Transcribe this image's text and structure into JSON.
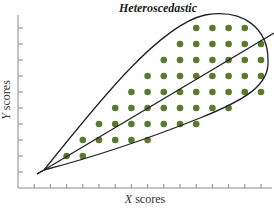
{
  "chart_data": {
    "type": "scatter",
    "title": "Heteroscedastic",
    "xlabel": "X scores",
    "ylabel": "Y scores",
    "xlabel_var": "X",
    "xlabel_rest": " scores",
    "ylabel_var": "Y",
    "ylabel_rest": " scores",
    "grid": false,
    "legend": null,
    "tick_labels": false,
    "x_ticks": 15,
    "y_ticks": 10,
    "annotations": [
      "teardrop-shaped envelope around points",
      "regression line through points"
    ],
    "point_color": "#5b7a2c",
    "points": [
      {
        "x": 3,
        "y": 2
      },
      {
        "x": 4,
        "y": 2
      },
      {
        "x": 4,
        "y": 3
      },
      {
        "x": 5,
        "y": 3
      },
      {
        "x": 6,
        "y": 3
      },
      {
        "x": 7,
        "y": 3
      },
      {
        "x": 8,
        "y": 3
      },
      {
        "x": 5,
        "y": 4
      },
      {
        "x": 6,
        "y": 4
      },
      {
        "x": 7,
        "y": 4
      },
      {
        "x": 8,
        "y": 4
      },
      {
        "x": 9,
        "y": 4
      },
      {
        "x": 10,
        "y": 4
      },
      {
        "x": 11,
        "y": 4
      },
      {
        "x": 6,
        "y": 5
      },
      {
        "x": 7,
        "y": 5
      },
      {
        "x": 8,
        "y": 5
      },
      {
        "x": 9,
        "y": 5
      },
      {
        "x": 10,
        "y": 5
      },
      {
        "x": 11,
        "y": 5
      },
      {
        "x": 12,
        "y": 5
      },
      {
        "x": 13,
        "y": 5
      },
      {
        "x": 7,
        "y": 6
      },
      {
        "x": 8,
        "y": 6
      },
      {
        "x": 9,
        "y": 6
      },
      {
        "x": 10,
        "y": 6
      },
      {
        "x": 11,
        "y": 6
      },
      {
        "x": 12,
        "y": 6
      },
      {
        "x": 13,
        "y": 6
      },
      {
        "x": 14,
        "y": 6
      },
      {
        "x": 15,
        "y": 6
      },
      {
        "x": 8,
        "y": 7
      },
      {
        "x": 9,
        "y": 7
      },
      {
        "x": 10,
        "y": 7
      },
      {
        "x": 11,
        "y": 7
      },
      {
        "x": 12,
        "y": 7
      },
      {
        "x": 13,
        "y": 7
      },
      {
        "x": 14,
        "y": 7
      },
      {
        "x": 15,
        "y": 7
      },
      {
        "x": 9,
        "y": 8
      },
      {
        "x": 10,
        "y": 8
      },
      {
        "x": 11,
        "y": 8
      },
      {
        "x": 12,
        "y": 8
      },
      {
        "x": 13,
        "y": 8
      },
      {
        "x": 14,
        "y": 8
      },
      {
        "x": 15,
        "y": 8
      },
      {
        "x": 10,
        "y": 9
      },
      {
        "x": 11,
        "y": 9
      },
      {
        "x": 12,
        "y": 9
      },
      {
        "x": 13,
        "y": 9
      },
      {
        "x": 14,
        "y": 9
      },
      {
        "x": 15,
        "y": 9
      },
      {
        "x": 11,
        "y": 10
      },
      {
        "x": 12,
        "y": 10
      },
      {
        "x": 13,
        "y": 10
      },
      {
        "x": 14,
        "y": 10
      }
    ],
    "xlim": [
      0,
      16
    ],
    "ylim": [
      0,
      11
    ]
  }
}
